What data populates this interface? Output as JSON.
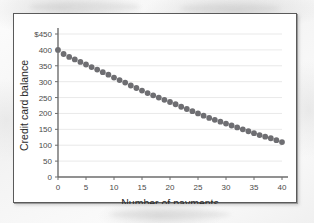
{
  "figure": {
    "background_color": "#f4f4f4",
    "plot_background_color": "#ffffff",
    "border_color": "#5a5a5a"
  },
  "chart_data": {
    "type": "scatter",
    "title": "",
    "xlabel": "Number of payments",
    "ylabel": "Credit card balance",
    "xlim": [
      0,
      40
    ],
    "ylim": [
      0,
      450
    ],
    "xticks": [
      0,
      5,
      10,
      15,
      20,
      25,
      30,
      35,
      40
    ],
    "xtick_labels": [
      "0",
      "5",
      "10",
      "15",
      "20",
      "25",
      "30",
      "35",
      "40"
    ],
    "yticks": [
      0,
      50,
      100,
      150,
      200,
      250,
      300,
      350,
      400,
      450
    ],
    "ytick_labels": [
      "0",
      "50",
      "100",
      "150",
      "200",
      "250",
      "300",
      "350",
      "400",
      "$450"
    ],
    "grid": "horizontal",
    "legend": "none",
    "marker": "circle",
    "marker_color": "#6e6e72",
    "marker_size": 4,
    "x": [
      0,
      1,
      2,
      3,
      4,
      5,
      6,
      7,
      8,
      9,
      10,
      11,
      12,
      13,
      14,
      15,
      16,
      17,
      18,
      19,
      20,
      21,
      22,
      23,
      24,
      25,
      26,
      27,
      28,
      29,
      30,
      31,
      32,
      33,
      34,
      35,
      36,
      37,
      38,
      39,
      40
    ],
    "y": [
      400,
      387,
      378,
      370,
      362,
      354,
      346,
      338,
      330,
      322,
      313,
      305,
      297,
      288,
      280,
      272,
      264,
      257,
      250,
      243,
      236,
      229,
      221,
      214,
      207,
      200,
      193,
      186,
      180,
      174,
      168,
      162,
      156,
      150,
      144,
      138,
      132,
      127,
      122,
      116,
      110
    ]
  }
}
